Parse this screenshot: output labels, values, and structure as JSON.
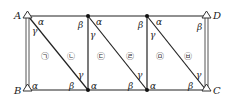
{
  "diagram": {
    "points": {
      "A": "A",
      "B": "B",
      "C": "C",
      "D": "D"
    },
    "angles": {
      "alpha": "α",
      "beta": "β",
      "gamma": "γ"
    },
    "regions": [
      "㉠",
      "㉡",
      "㉢",
      "㉣",
      "㉤",
      "㉥"
    ],
    "colors": {
      "line": "#222222",
      "post": "#555555",
      "background": "#ffffff"
    }
  }
}
